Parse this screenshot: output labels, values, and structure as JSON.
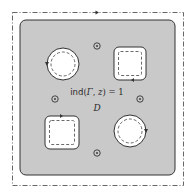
{
  "diagram": {
    "region_label": "D",
    "index_label": "ind(Γ, z) = 1",
    "index_label_parts": {
      "func": "ind",
      "open": "(",
      "gamma": "Γ",
      "comma": ", ",
      "z": "z",
      "close": ") = 1"
    },
    "colors": {
      "region_fill": "#c9c9c9",
      "hole_fill": "#ffffff",
      "stroke": "#333333"
    },
    "holes": [
      {
        "shape": "circle",
        "position": "top-left",
        "orientation_arrow": "left-side"
      },
      {
        "shape": "square",
        "position": "top-right",
        "orientation_arrow": "bottom-side"
      },
      {
        "shape": "square",
        "position": "bottom-left",
        "orientation_arrow": "top-side"
      },
      {
        "shape": "circle",
        "position": "bottom-right",
        "orientation_arrow": "right-side"
      }
    ],
    "points": [
      {
        "symbol": "circled-dot",
        "position": "top"
      },
      {
        "symbol": "circled-dot",
        "position": "left"
      },
      {
        "symbol": "circled-dot",
        "position": "right"
      },
      {
        "symbol": "circled-dot",
        "position": "bottom"
      }
    ],
    "outer_contour": "dash-dot",
    "inner_contours": "dashed"
  }
}
